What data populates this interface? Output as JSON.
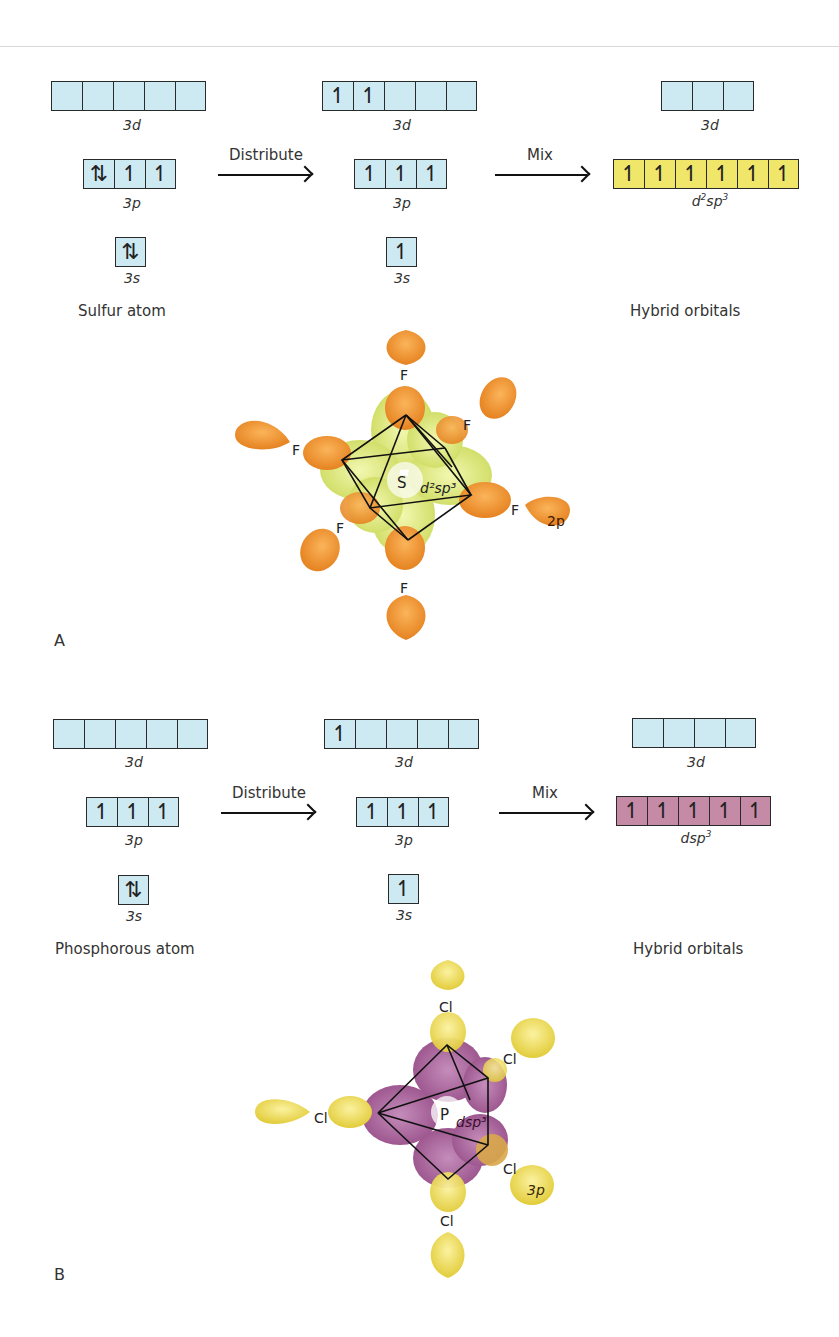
{
  "panels": {
    "a": {
      "letter": "A",
      "atom_caption": "Sulfur atom",
      "hybrid_caption": "Hybrid orbitals",
      "distribute_label": "Distribute",
      "mix_label": "Mix",
      "ground": {
        "d": {
          "label": "3d",
          "boxes": [
            "",
            "",
            "",
            "",
            ""
          ]
        },
        "p": {
          "label": "3p",
          "boxes": [
            "⇅",
            "↿",
            "↿"
          ]
        },
        "s": {
          "label": "3s",
          "boxes": [
            "⇅"
          ]
        }
      },
      "excited": {
        "d": {
          "label": "3d",
          "boxes": [
            "↿",
            "↿",
            "",
            "",
            ""
          ]
        },
        "p": {
          "label": "3p",
          "boxes": [
            "↿",
            "↿",
            "↿"
          ]
        },
        "s": {
          "label": "3s",
          "boxes": [
            "↿"
          ]
        }
      },
      "hybrid": {
        "d": {
          "label": "3d",
          "boxes": [
            "",
            "",
            ""
          ]
        },
        "h": {
          "label_base": "d",
          "label_sup1": "2",
          "label_mid": "sp",
          "label_sup2": "3",
          "boxes": [
            "↿",
            "↿",
            "↿",
            "↿",
            "↿",
            "↿"
          ]
        }
      },
      "molecule": {
        "center_atom": "S",
        "hybrid_label": "d²sp³",
        "ligand": "F",
        "ligand_orbital": "2p",
        "colors": {
          "ligand": "#f0922a",
          "center": "#d2df5a"
        }
      }
    },
    "b": {
      "letter": "B",
      "atom_caption": "Phosphorous atom",
      "hybrid_caption": "Hybrid orbitals",
      "distribute_label": "Distribute",
      "mix_label": "Mix",
      "ground": {
        "d": {
          "label": "3d",
          "boxes": [
            "",
            "",
            "",
            "",
            ""
          ]
        },
        "p": {
          "label": "3p",
          "boxes": [
            "↿",
            "↿",
            "↿"
          ]
        },
        "s": {
          "label": "3s",
          "boxes": [
            "⇅"
          ]
        }
      },
      "excited": {
        "d": {
          "label": "3d",
          "boxes": [
            "↿",
            "",
            "",
            "",
            ""
          ]
        },
        "p": {
          "label": "3p",
          "boxes": [
            "↿",
            "↿",
            "↿"
          ]
        },
        "s": {
          "label": "3s",
          "boxes": [
            "↿"
          ]
        }
      },
      "hybrid": {
        "d": {
          "label": "3d",
          "boxes": [
            "",
            "",
            "",
            ""
          ]
        },
        "h": {
          "label_base": "dsp",
          "label_sup": "3",
          "boxes": [
            "↿",
            "↿",
            "↿",
            "↿",
            "↿"
          ]
        }
      },
      "molecule": {
        "center_atom": "P",
        "hybrid_label": "dsp³",
        "ligand": "Cl",
        "ligand_orbital": "3p",
        "colors": {
          "ligand": "#ecd94a",
          "center": "#9a4f8c"
        }
      }
    }
  }
}
